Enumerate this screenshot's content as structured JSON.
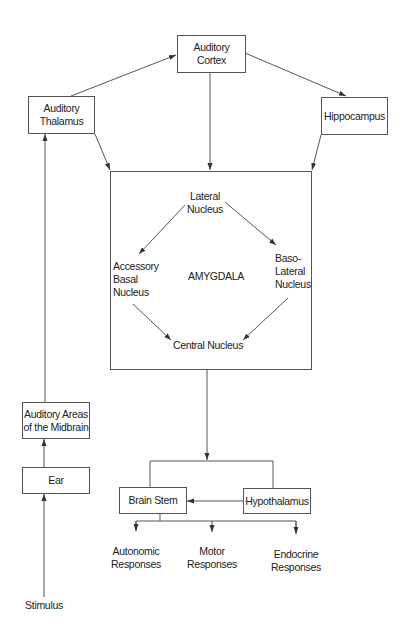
{
  "diagram": {
    "nodes": {
      "auditory_cortex": {
        "line1": "Auditory",
        "line2": "Cortex"
      },
      "auditory_thalamus": {
        "line1": "Auditory",
        "line2": "Thalamus"
      },
      "hippocampus": {
        "line1": "Hippocampus"
      },
      "amygdala": {
        "label": "AMYGDALA"
      },
      "lateral_nucleus": {
        "line1": "Lateral",
        "line2": "Nucleus"
      },
      "accessory_basal_nucleus": {
        "line1": "Accessory",
        "line2": "Basal",
        "line3": "Nucleus"
      },
      "basolateral_nucleus": {
        "line1": "Baso-",
        "line2": "Lateral",
        "line3": "Nucleus"
      },
      "central_nucleus": {
        "line1": "Central Nucleus"
      },
      "auditory_midbrain": {
        "line1": "Auditory Areas",
        "line2": "of the Midbrain"
      },
      "ear": {
        "line1": "Ear"
      },
      "stimulus": {
        "line1": "Stimulus"
      },
      "brain_stem": {
        "line1": "Brain Stem"
      },
      "hypothalamus": {
        "line1": "Hypothalamus"
      },
      "autonomic_responses": {
        "line1": "Autonomic",
        "line2": "Responses"
      },
      "motor_responses": {
        "line1": "Motor",
        "line2": "Responses"
      },
      "endocrine_responses": {
        "line1": "Endocrine",
        "line2": "Responses"
      }
    },
    "edges": [
      [
        "stimulus",
        "ear"
      ],
      [
        "ear",
        "auditory_midbrain"
      ],
      [
        "auditory_midbrain",
        "auditory_thalamus"
      ],
      [
        "auditory_thalamus",
        "auditory_cortex"
      ],
      [
        "auditory_thalamus",
        "amygdala"
      ],
      [
        "auditory_cortex",
        "amygdala"
      ],
      [
        "auditory_cortex",
        "hippocampus"
      ],
      [
        "hippocampus",
        "amygdala"
      ],
      [
        "lateral_nucleus",
        "accessory_basal_nucleus"
      ],
      [
        "lateral_nucleus",
        "basolateral_nucleus"
      ],
      [
        "accessory_basal_nucleus",
        "central_nucleus"
      ],
      [
        "basolateral_nucleus",
        "central_nucleus"
      ],
      [
        "central_nucleus",
        "brain_stem"
      ],
      [
        "central_nucleus",
        "hypothalamus"
      ],
      [
        "hypothalamus",
        "brain_stem"
      ],
      [
        "brain_stem",
        "autonomic_responses"
      ],
      [
        "brain_stem",
        "motor_responses"
      ],
      [
        "brain_stem",
        "endocrine_responses"
      ]
    ],
    "colors": {
      "line": "#555555",
      "text": "#222222",
      "background": "#ffffff"
    }
  }
}
